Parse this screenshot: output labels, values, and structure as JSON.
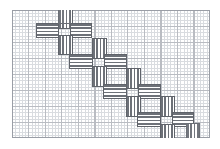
{
  "document": {
    "title": "Graph paper pattern sheet",
    "description": "Diagonal chain of woven pinwheel motifs drawn on grid paper"
  },
  "sheet": {
    "name": "graph-paper",
    "x": 12,
    "y": 10,
    "width": 198,
    "height": 128,
    "background_color": "#ffffff",
    "minor_grid_color": "#d9dce0",
    "major_grid_color": "#b9bcc2",
    "border_color": "#9a9ea6",
    "minor_cell_px": 3.3,
    "major_cell_px": 16.5
  },
  "pattern": {
    "name": "woven-pinwheel-diagonal-chain",
    "stripe_color": "#6d7178",
    "outline_color": "#5f636a",
    "fill_color": "#ffffff",
    "motif_count": 4,
    "direction": "upper-left to lower-right",
    "motifs": [
      {
        "id": "motif-1",
        "x": 46,
        "y": 10,
        "size": 42,
        "label": "pinwheel-1"
      },
      {
        "id": "motif-2",
        "x": 82,
        "y": 42,
        "size": 42,
        "label": "pinwheel-2"
      },
      {
        "id": "motif-3",
        "x": 116,
        "y": 72,
        "size": 42,
        "label": "pinwheel-3"
      },
      {
        "id": "motif-4",
        "x": 150,
        "y": 100,
        "size": 42,
        "label": "pinwheel-4"
      }
    ],
    "end_fragments": [
      {
        "id": "fragment-top",
        "orientation": "vertical",
        "x": 46,
        "y": 10
      },
      {
        "id": "fragment-bottom",
        "orientation": "vertical",
        "x": 186,
        "y": 118
      }
    ]
  }
}
